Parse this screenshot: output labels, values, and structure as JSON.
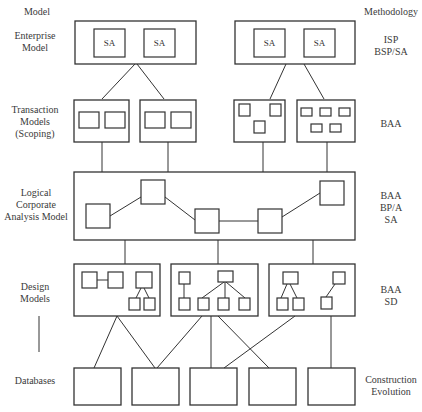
{
  "headers": {
    "left": "Model",
    "right": "Methodology"
  },
  "levels": [
    {
      "id": "enterprise",
      "model_lines": [
        "Enterprise",
        "Model"
      ],
      "methodology_lines": [
        "ISP",
        "BSP/SA"
      ]
    },
    {
      "id": "transaction",
      "model_lines": [
        "Transaction",
        "Models",
        "(Scoping)"
      ],
      "methodology_lines": [
        "BAA"
      ]
    },
    {
      "id": "logical",
      "model_lines": [
        "Logical",
        "Corporate",
        "Analysis Model"
      ],
      "methodology_lines": [
        "BAA",
        "BP/A",
        "SA"
      ]
    },
    {
      "id": "design",
      "model_lines": [
        "Design",
        "Models"
      ],
      "methodology_lines": [
        "BAA",
        "SD"
      ]
    },
    {
      "id": "databases",
      "model_lines": [
        "Databases"
      ],
      "methodology_lines": [
        "Construction",
        "Evolution"
      ]
    }
  ],
  "enterprise_boxes": [
    {
      "subject_areas": [
        "SA",
        "SA"
      ]
    },
    {
      "subject_areas": [
        "SA",
        "SA"
      ]
    }
  ],
  "transaction_model_count": 4,
  "design_model_count": 3,
  "database_count": 5,
  "colors": {
    "stroke": "#333333",
    "text": "#3a3a3a",
    "background": "#ffffff"
  }
}
